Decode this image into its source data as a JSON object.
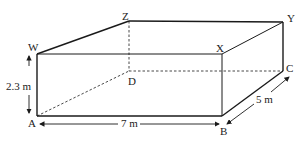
{
  "diagram": {
    "type": "cuboid",
    "vertices": {
      "W": "W",
      "X": "X",
      "Y": "Y",
      "Z": "Z",
      "A": "A",
      "B": "B",
      "C": "C",
      "D": "D"
    },
    "dimensions": {
      "height": "2.3 m",
      "length": "7 m",
      "width": "5 m"
    },
    "colors": {
      "line": "#1a1a1a",
      "text": "#222222"
    }
  }
}
